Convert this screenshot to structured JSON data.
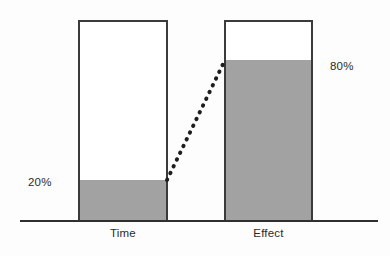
{
  "chart_data": {
    "type": "bar",
    "title": "",
    "subtitle": "",
    "xlabel": "",
    "ylabel": "",
    "categories": [
      "Time",
      "Effect"
    ],
    "values": [
      20,
      80
    ],
    "value_labels": [
      "20%",
      "80%"
    ],
    "unit": "%",
    "ylim": [
      0,
      100
    ],
    "grid": false,
    "legend": false,
    "legend_position": "none",
    "series": [
      {
        "name": "",
        "values": [
          20,
          80
        ]
      }
    ],
    "annotations": [
      {
        "type": "dotted-connector",
        "from_category": "Time",
        "to_category": "Effect",
        "from_value": 20,
        "to_value": 80,
        "style": "dotted"
      }
    ],
    "style": {
      "fill_color": "#a2a2a2",
      "outline_color": "#3b3b3b",
      "baseline_color": "#2f2f2f",
      "background_color": "#fdfdfd",
      "text_color": "#2b2b2b",
      "connector_color": "#1d1d1d"
    }
  },
  "bars": [
    {
      "category": "Time",
      "value_label": "20%",
      "fill_percent": 20
    },
    {
      "category": "Effect",
      "value_label": "80%",
      "fill_percent": 80
    }
  ]
}
